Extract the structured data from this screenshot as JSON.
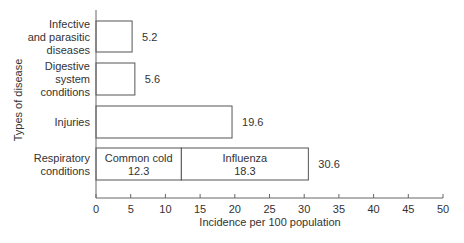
{
  "chart_data": {
    "type": "bar",
    "orientation": "horizontal",
    "stacked": true,
    "title": "",
    "xlabel": "Incidence per 100 population",
    "ylabel": "Types of disease",
    "xlim": [
      0,
      50
    ],
    "xticks": [
      0,
      5,
      10,
      15,
      20,
      25,
      30,
      35,
      40,
      45,
      50
    ],
    "grid": false,
    "legend": null,
    "categories": [
      [
        "Infective",
        "and parasitic",
        "diseases"
      ],
      [
        "Digestive",
        "system",
        "conditions"
      ],
      [
        "Injuries"
      ],
      [
        "Respiratory",
        "conditions"
      ]
    ],
    "totals": [
      5.2,
      5.6,
      19.6,
      30.6
    ],
    "segments": [
      [
        {
          "label": "",
          "value": 5.2
        }
      ],
      [
        {
          "label": "",
          "value": 5.6
        }
      ],
      [
        {
          "label": "",
          "value": 19.6
        }
      ],
      [
        {
          "label": "Common cold",
          "value": 12.3
        },
        {
          "label": "Influenza",
          "value": 18.3
        }
      ]
    ],
    "total_labels": [
      "5.2",
      "5.6",
      "19.6",
      "30.6"
    ]
  },
  "colors": {
    "bar_fill": "#ffffff",
    "bar_stroke": "#555555",
    "axis": "#666666",
    "text": "#333333"
  }
}
